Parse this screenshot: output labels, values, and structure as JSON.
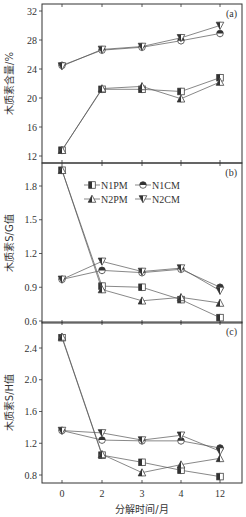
{
  "chart_data": [
    {
      "type": "line",
      "panel": "(a)",
      "title": "",
      "xlabel": "分解时间/月",
      "ylabel": "木质素含量/%",
      "categories": [
        "0",
        "2",
        "3",
        "4",
        "12"
      ],
      "ylim": [
        11,
        33
      ],
      "yticks": [
        12,
        16,
        20,
        24,
        28,
        32
      ],
      "series": [
        {
          "name": "N1PM",
          "values": [
            12.8,
            21.2,
            21.2,
            20.9,
            22.8
          ]
        },
        {
          "name": "N1CM",
          "values": [
            24.5,
            26.6,
            27.0,
            27.9,
            28.9
          ]
        },
        {
          "name": "N2PM",
          "values": [
            12.8,
            21.3,
            21.6,
            19.9,
            22.2
          ]
        },
        {
          "name": "N2CM",
          "values": [
            24.4,
            26.7,
            27.1,
            28.3,
            30.0
          ]
        }
      ]
    },
    {
      "type": "line",
      "panel": "(b)",
      "title": "",
      "xlabel": "分解时间/月",
      "ylabel": "木质素S/G值",
      "categories": [
        "0",
        "2",
        "3",
        "4",
        "12"
      ],
      "ylim": [
        0.58,
        2.0
      ],
      "yticks": [
        0.6,
        0.9,
        1.2,
        1.5,
        1.8
      ],
      "series": [
        {
          "name": "N1PM",
          "values": [
            1.94,
            0.91,
            0.9,
            0.79,
            0.63
          ]
        },
        {
          "name": "N1CM",
          "values": [
            0.97,
            1.05,
            1.03,
            1.06,
            0.9
          ]
        },
        {
          "name": "N2PM",
          "values": [
            1.94,
            0.88,
            0.78,
            0.81,
            0.76
          ]
        },
        {
          "name": "N2CM",
          "values": [
            0.97,
            1.13,
            1.04,
            1.07,
            0.87
          ]
        }
      ]
    },
    {
      "type": "line",
      "panel": "(c)",
      "title": "",
      "xlabel": "分解时间/月",
      "ylabel": "木质素S/H值",
      "categories": [
        "0",
        "2",
        "3",
        "4",
        "12"
      ],
      "ylim": [
        0.7,
        2.7
      ],
      "yticks": [
        0.8,
        1.2,
        1.6,
        2.0,
        2.4
      ],
      "series": [
        {
          "name": "N1PM",
          "values": [
            2.53,
            1.05,
            0.96,
            0.86,
            0.78
          ]
        },
        {
          "name": "N1CM",
          "values": [
            1.36,
            1.24,
            1.23,
            1.23,
            1.14
          ]
        },
        {
          "name": "N2PM",
          "values": [
            2.54,
            1.06,
            0.83,
            0.93,
            1.01
          ]
        },
        {
          "name": "N2CM",
          "values": [
            1.36,
            1.33,
            1.24,
            1.3,
            1.1
          ]
        }
      ]
    }
  ],
  "legend": [
    {
      "name": "N1PM",
      "marker": "square"
    },
    {
      "name": "N1CM",
      "marker": "circle"
    },
    {
      "name": "N2PM",
      "marker": "triangle-up"
    },
    {
      "name": "N2CM",
      "marker": "triangle-down"
    }
  ],
  "panel_tags": [
    "(a)",
    "(b)",
    "(c)"
  ],
  "colors": {
    "axis": "#333333",
    "line": "#555555",
    "marker_fill": "#333333"
  }
}
